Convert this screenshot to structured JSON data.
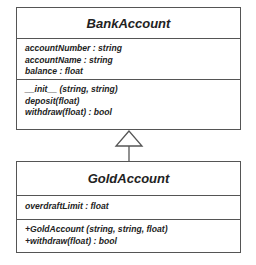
{
  "diagram": {
    "type": "UML class diagram",
    "relationship": "inheritance",
    "colors": {
      "border": "#555555",
      "text": "#222222",
      "background": "#ffffff"
    },
    "classes": [
      {
        "name": "BankAccount",
        "attributes": [
          "accountNumber : string",
          "accountName : string",
          "balance : float"
        ],
        "operations": [
          "__init__ (string, string)",
          "deposit(float)",
          "withdraw(float) : bool"
        ]
      },
      {
        "name": "GoldAccount",
        "attributes": [
          "overdraftLimit : float"
        ],
        "operations": [
          "+GoldAccount (string, string, float)",
          "+withdraw(float) : bool"
        ]
      }
    ],
    "edges": [
      {
        "from": "GoldAccount",
        "to": "BankAccount",
        "type": "generalization"
      }
    ]
  }
}
